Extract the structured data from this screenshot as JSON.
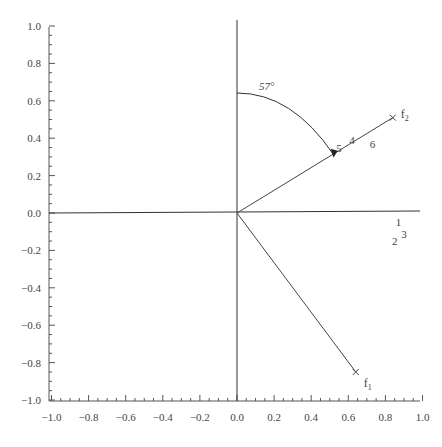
{
  "chart_data": {
    "type": "scatter",
    "title": "",
    "xlabel": "",
    "ylabel": "",
    "xlim": [
      -1.0,
      1.0
    ],
    "ylim": [
      -1.0,
      1.0
    ],
    "grid": false,
    "x_ticks": [
      "-1.0",
      "-0.8",
      "-0.6",
      "-0.4",
      "-0.2",
      "0.0",
      "0.2",
      "0.4",
      "0.6",
      "0.8",
      "1.0"
    ],
    "y_ticks": [
      "1.0",
      "0.8",
      "0.6",
      "0.4",
      "0.2",
      "0.0",
      "-0.2",
      "-0.4",
      "-0.6",
      "-0.8",
      "-1.0"
    ],
    "vectors": [
      {
        "name": "f1",
        "label_main": "f",
        "label_sub": "1",
        "x": 0.64,
        "y": -0.85
      },
      {
        "name": "f2",
        "label_main": "f",
        "label_sub": "2",
        "x": 0.84,
        "y": 0.51
      }
    ],
    "points": [
      {
        "label": "1",
        "x": 0.87,
        "y": -0.05
      },
      {
        "label": "2",
        "x": 0.85,
        "y": -0.15
      },
      {
        "label": "3",
        "x": 0.9,
        "y": -0.11
      },
      {
        "label": "4",
        "x": 0.62,
        "y": 0.39
      },
      {
        "label": "5",
        "x": 0.55,
        "y": 0.35
      },
      {
        "label": "6",
        "x": 0.73,
        "y": 0.37
      }
    ],
    "annotations": [
      {
        "text": "57°",
        "type": "angle-arc",
        "from_axis": "vertical",
        "to_vector": "f2"
      }
    ]
  }
}
